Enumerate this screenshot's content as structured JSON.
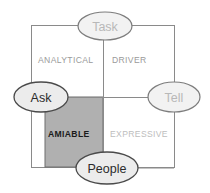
{
  "diagram": {
    "type": "social-styles-matrix",
    "background_color": "#ffffff",
    "frame": {
      "stroke": "#8a8a8a",
      "x": 31,
      "y": 25,
      "width": 143,
      "height": 142
    },
    "axes": {
      "vertical": {
        "label_top": "Task",
        "label_bottom": "People",
        "x": 103
      },
      "horizontal": {
        "label_left": "Ask",
        "label_right": "Tell",
        "y": 97
      },
      "stroke": "#8a8a8a"
    },
    "highlight": {
      "quadrant": "AMIABLE",
      "fill": "#b0b0b0",
      "stroke": "#6e6e6e",
      "x": 45,
      "y": 97,
      "width": 58,
      "height": 70
    },
    "endpoints": [
      {
        "id": "task",
        "label": "Task",
        "cx": 105,
        "cy": 26,
        "rx": 27,
        "ry": 14,
        "fill": "#f2f2f2",
        "stroke": "#7d7d7d",
        "text_color": "#b8b8b8"
      },
      {
        "id": "ask",
        "label": "Ask",
        "cx": 41,
        "cy": 97,
        "rx": 27,
        "ry": 15,
        "fill": "#ececec",
        "stroke": "#4a4a4a",
        "text_color": "#2b2b2b"
      },
      {
        "id": "tell",
        "label": "Tell",
        "cx": 174,
        "cy": 97,
        "rx": 26,
        "ry": 15,
        "fill": "#f2f2f2",
        "stroke": "#7d7d7d",
        "text_color": "#b8b8b8"
      },
      {
        "id": "people",
        "label": "People",
        "cx": 107,
        "cy": 168,
        "rx": 31,
        "ry": 16,
        "fill": "#ececec",
        "stroke": "#4a4a4a",
        "text_color": "#2b2b2b"
      }
    ],
    "quadrants": [
      {
        "id": "analytical",
        "label": "ANALYTICAL",
        "x": 38,
        "y": 60,
        "text_color": "#9a9a9a",
        "weight": "normal"
      },
      {
        "id": "driver",
        "label": "DRIVER",
        "x": 112,
        "y": 60,
        "text_color": "#9a9a9a",
        "weight": "normal"
      },
      {
        "id": "amiable",
        "label": "AMIABLE",
        "x": 48,
        "y": 134,
        "text_color": "#1a1a1a",
        "weight": "bold"
      },
      {
        "id": "expressive",
        "label": "EXPRESSIVE",
        "x": 110,
        "y": 134,
        "text_color": "#bdbdbd",
        "weight": "normal"
      }
    ]
  }
}
